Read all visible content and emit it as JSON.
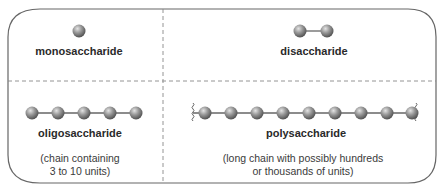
{
  "colors": {
    "border": "#555555",
    "divider": "#888888",
    "sphere_light": "#d8d8d8",
    "sphere_dark": "#5a5a5a",
    "bond": "#666666",
    "text": "#2a2a2a"
  },
  "panels": {
    "monosaccharide": {
      "label": "monosaccharide",
      "units_shown": 1
    },
    "disaccharide": {
      "label": "disaccharide",
      "units_shown": 2
    },
    "oligosaccharide": {
      "label": "oligosaccharide",
      "units_shown": 5,
      "description_line1": "(chain containing",
      "description_line2": "3 to 10 units)"
    },
    "polysaccharide": {
      "label": "polysaccharide",
      "units_shown": 9,
      "chain_continues": true,
      "description_line1": "(long chain with possibly hundreds",
      "description_line2": "or thousands of units)"
    }
  }
}
